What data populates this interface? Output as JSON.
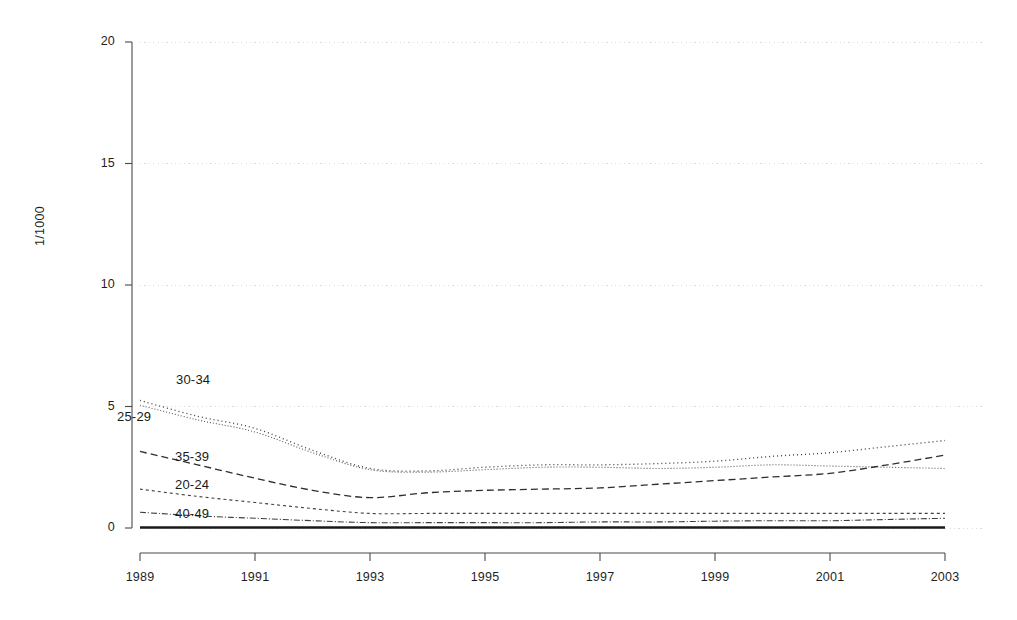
{
  "chart_data": {
    "type": "line",
    "title": "",
    "subtitle": "",
    "xlabel": "",
    "ylabel": "1/1000",
    "xlim": [
      1989,
      2003
    ],
    "ylim": [
      0,
      20
    ],
    "grid": true,
    "grid_axis": "y",
    "legend_position": "inline-labels",
    "x": [
      1989,
      1990,
      1991,
      1992,
      1993,
      1994,
      1995,
      1996,
      1997,
      1998,
      1999,
      2000,
      2001,
      2002,
      2003
    ],
    "yticks": [
      0,
      5,
      10,
      15,
      20
    ],
    "ytick_labels": [
      "0",
      "5",
      "10",
      "15",
      "20"
    ],
    "xticks": [
      1989,
      1991,
      1993,
      1995,
      1997,
      1999,
      2001,
      2003
    ],
    "xtick_labels": [
      "1989",
      "1991",
      "1993",
      "1995",
      "1997",
      "1999",
      "2001",
      "2003"
    ],
    "series": [
      {
        "name": "30-34",
        "label": "30-34",
        "dash": "1,3",
        "width": 1.3,
        "color": "#3a3a3a",
        "values": [
          5.25,
          4.6,
          4.1,
          3.2,
          2.45,
          2.35,
          2.5,
          2.6,
          2.6,
          2.65,
          2.75,
          2.95,
          3.1,
          3.35,
          3.6
        ]
      },
      {
        "name": "25-29",
        "label": "25-29",
        "dash": "1,2",
        "width": 1.1,
        "color": "#555555",
        "values": [
          5.05,
          4.45,
          3.95,
          3.1,
          2.4,
          2.3,
          2.4,
          2.5,
          2.5,
          2.45,
          2.5,
          2.6,
          2.55,
          2.5,
          2.45
        ]
      },
      {
        "name": "35-39",
        "label": "35-39",
        "dash": "7,4",
        "width": 1.3,
        "color": "#2e2e2e",
        "values": [
          3.15,
          2.6,
          2.05,
          1.55,
          1.25,
          1.45,
          1.55,
          1.6,
          1.65,
          1.8,
          1.95,
          2.1,
          2.25,
          2.6,
          3.0
        ]
      },
      {
        "name": "20-24",
        "label": "20-24",
        "dash": "3,3",
        "width": 1.1,
        "color": "#3f3f3f",
        "values": [
          1.6,
          1.3,
          1.05,
          0.8,
          0.6,
          0.6,
          0.6,
          0.6,
          0.6,
          0.6,
          0.6,
          0.6,
          0.6,
          0.6,
          0.6
        ]
      },
      {
        "name": "40-49",
        "label": "40-49",
        "dash": "6,2,1,2",
        "width": 1.1,
        "color": "#3f3f3f",
        "values": [
          0.65,
          0.5,
          0.4,
          0.3,
          0.22,
          0.22,
          0.22,
          0.22,
          0.25,
          0.25,
          0.28,
          0.3,
          0.3,
          0.35,
          0.4
        ]
      },
      {
        "name": "baseline",
        "label": "",
        "dash": "solid",
        "width": 2.4,
        "color": "#1a1a1a",
        "values": [
          0.02,
          0.02,
          0.02,
          0.02,
          0.02,
          0.02,
          0.02,
          0.02,
          0.02,
          0.02,
          0.02,
          0.02,
          0.02,
          0.02,
          0.02
        ]
      }
    ],
    "inline_labels": [
      {
        "text": "30-34",
        "x_px": 176,
        "y_px": 372
      },
      {
        "text": "25-29",
        "x_px": 117,
        "y_px": 409
      },
      {
        "text": "35-39",
        "x_px": 175,
        "y_px": 449
      },
      {
        "text": "20-24",
        "x_px": 175,
        "y_px": 477
      },
      {
        "text": "40-49",
        "x_px": 175,
        "y_px": 506
      }
    ]
  }
}
